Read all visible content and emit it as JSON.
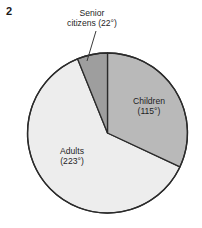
{
  "figure": {
    "number": "2",
    "background_color": "#ffffff"
  },
  "chart_data": {
    "type": "pie",
    "title": "",
    "subtitle": "",
    "xlabel": "",
    "ylabel": "",
    "legend_position": "none",
    "grid": false,
    "units": "degrees",
    "total_degrees": 360,
    "start_angle_deg": 0,
    "direction": "clockwise",
    "categories": [
      "Children",
      "Adults",
      "Senior citizens"
    ],
    "values": [
      115,
      223,
      22
    ],
    "labels": [
      "Children (115°)",
      "Adults (223°)",
      "Senior citizens (22°)"
    ],
    "colors": [
      "#b9b9b9",
      "#ededed",
      "#9e9e9e"
    ],
    "slices": [
      {
        "name": "Children",
        "label_line1": "Children",
        "label_line2": "(115°)",
        "value_deg": 115,
        "start_deg": 0,
        "end_deg": 115,
        "color": "#b9b9b9",
        "label_placement": "inside"
      },
      {
        "name": "Adults",
        "label_line1": "Adults",
        "label_line2": "(223°)",
        "value_deg": 223,
        "start_deg": 115,
        "end_deg": 338,
        "color": "#ededed",
        "label_placement": "inside"
      },
      {
        "name": "Senior citizens",
        "label_line1": "Senior",
        "label_line2": "citizens (22°)",
        "value_deg": 22,
        "start_deg": 338,
        "end_deg": 360,
        "color": "#9e9e9e",
        "label_placement": "callout"
      }
    ],
    "outline_color": "#2b2b2b"
  }
}
